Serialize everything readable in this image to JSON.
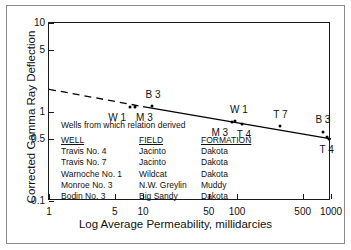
{
  "chart_data": {
    "type": "scatter",
    "title": "",
    "xlabel": "Log Average Permeability, millidarcies",
    "ylabel": "Corrected Gamma Ray Deflection",
    "xscale": "log",
    "yscale": "log",
    "xlim": [
      1,
      1000
    ],
    "ylim": [
      0.1,
      10
    ],
    "grid": false,
    "legend_position": "inside-lower-left",
    "xticks": [
      {
        "value": 1,
        "label": "1"
      },
      {
        "value": 5,
        "label": "5"
      },
      {
        "value": 10,
        "label": "10"
      },
      {
        "value": 50,
        "label": "50"
      },
      {
        "value": 100,
        "label": "100"
      },
      {
        "value": 500,
        "label": "500"
      },
      {
        "value": 1000,
        "label": "1000"
      }
    ],
    "yticks": [
      {
        "value": 10,
        "label": "10"
      },
      {
        "value": 5,
        "label": "5"
      },
      {
        "value": 1,
        "label": "1"
      },
      {
        "value": 0.5,
        "label": "0.5"
      },
      {
        "value": 0.1,
        "label": "0.1"
      }
    ],
    "points": [
      {
        "label": "W 1",
        "x": 7.3,
        "y": 1.13,
        "label_dx": -13,
        "label_dy": 11
      },
      {
        "label": "M 3",
        "x": 8.3,
        "y": 1.13,
        "label_dx": 9,
        "label_dy": 11
      },
      {
        "label": "B 3",
        "x": 12.5,
        "y": 1.17,
        "label_dx": 1,
        "label_dy": -11
      },
      {
        "label": "W 1",
        "x": 95,
        "y": 0.8,
        "label_dx": 4,
        "label_dy": -11
      },
      {
        "label": "M 3",
        "x": 88,
        "y": 0.78,
        "label_dx": -12,
        "label_dy": 11
      },
      {
        "label": "T 4",
        "x": 113,
        "y": 0.74,
        "label_dx": 2,
        "label_dy": 11
      },
      {
        "label": "T 7",
        "x": 290,
        "y": 0.7,
        "label_dx": 0,
        "label_dy": -11
      },
      {
        "label": "B 3",
        "x": 820,
        "y": 0.6,
        "label_dx": 0,
        "label_dy": -12
      },
      {
        "label": "T 4",
        "x": 900,
        "y": 0.52,
        "label_dx": 0,
        "label_dy": 13
      },
      {
        "label": "",
        "x": 960,
        "y": 0.5,
        "label_dx": 0,
        "label_dy": 0
      }
    ],
    "trend_line": {
      "dashed_segment": {
        "x0": 1,
        "y0": 1.8,
        "x1": 10,
        "y1": 1.15
      },
      "solid_segment": {
        "x0": 10,
        "y0": 1.15,
        "x1": 1000,
        "y1": 0.5
      },
      "color": "#000000"
    },
    "legend": {
      "note": "Wells from which relation derived",
      "columns": [
        "WELL",
        "FIELD",
        "FORMATION"
      ],
      "rows": [
        [
          "Travis No. 4",
          "Jacinto",
          "Dakota"
        ],
        [
          "Travis No. 7",
          "Jacinto",
          "Dakota"
        ],
        [
          "Warnoche No. 1",
          "Wildcat",
          "Dakota"
        ],
        [
          "Monroe No. 3",
          "N.W. Greylin",
          "Muddy"
        ],
        [
          "Bodin No. 3",
          "Big Sandy",
          "Dakota"
        ]
      ]
    }
  }
}
